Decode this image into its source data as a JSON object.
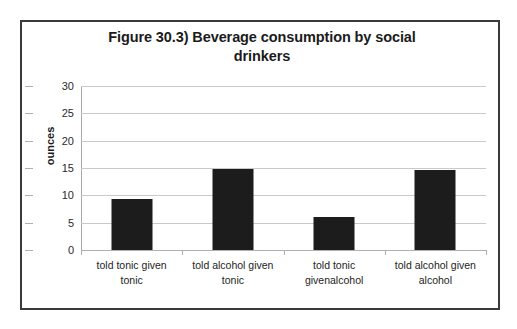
{
  "figure": {
    "title_line1": "Figure 30.3) Beverage consumption by social",
    "title_line2": "drinkers",
    "frame_color": "#3a3a3a",
    "bar_color": "#1c1c1c",
    "gridline_color": "#c9c9c9"
  },
  "chart_data": {
    "type": "bar",
    "title": "Figure 30.3) Beverage consumption by social drinkers",
    "xlabel": "",
    "ylabel": "ounces",
    "ylim": [
      0,
      30
    ],
    "yticks": [
      0,
      5,
      10,
      15,
      20,
      25,
      30
    ],
    "ytick_labels": [
      "0",
      "5",
      "10",
      "15",
      "20",
      "25",
      "30"
    ],
    "grid": true,
    "legend": false,
    "categories": [
      "told tonic given tonic",
      "told alcohol given tonic",
      "told tonic givenalcohol",
      "told alcohol given alcohol"
    ],
    "category_lines": [
      [
        "told tonic given",
        "tonic"
      ],
      [
        "told alcohol given",
        "tonic"
      ],
      [
        "told tonic",
        "givenalcohol"
      ],
      [
        "told alcohol given",
        "alcohol"
      ]
    ],
    "values": [
      9.3,
      14.8,
      6.1,
      14.7
    ],
    "series": [
      {
        "name": "ounces",
        "values": [
          9.3,
          14.8,
          6.1,
          14.7
        ]
      }
    ]
  }
}
